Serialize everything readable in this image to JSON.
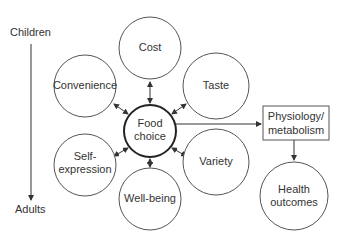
{
  "diagram": {
    "timeline": {
      "top_label": "Children",
      "bottom_label": "Adults"
    },
    "center": {
      "line1": "Food",
      "line2": "choice"
    },
    "factors": [
      {
        "id": "cost",
        "line1": "Cost",
        "line2": ""
      },
      {
        "id": "convenience",
        "line1": "Convenience",
        "line2": ""
      },
      {
        "id": "taste",
        "line1": "Taste",
        "line2": ""
      },
      {
        "id": "self-expression",
        "line1": "Self-",
        "line2": "expression"
      },
      {
        "id": "variety",
        "line1": "Variety",
        "line2": ""
      },
      {
        "id": "well-being",
        "line1": "Well-being",
        "line2": ""
      }
    ],
    "physiology": {
      "line1": "Physiology/",
      "line2": "metabolism"
    },
    "outcome": {
      "line1": "Health",
      "line2": "outcomes"
    }
  }
}
